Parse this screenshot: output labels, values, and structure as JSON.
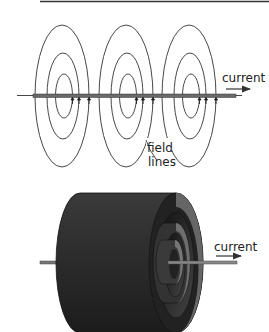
{
  "figure": {
    "top_rule": true,
    "top_diagram": {
      "description": "Straight current-carrying wire with concentric circular magnetic field lines",
      "current_label": "current",
      "field_label_line1": "field",
      "field_label_line2": "lines",
      "loop_count": 3,
      "rings_per_loop": 3
    },
    "bottom_diagram": {
      "description": "Cut-away cylinder showing nested cylindrical field surfaces around a wire",
      "current_label": "current"
    },
    "colors": {
      "line": "#333333",
      "wire": "#555555",
      "cylinder_dark": "#2a2a2a",
      "cylinder_face": "#6e6e6e"
    }
  }
}
